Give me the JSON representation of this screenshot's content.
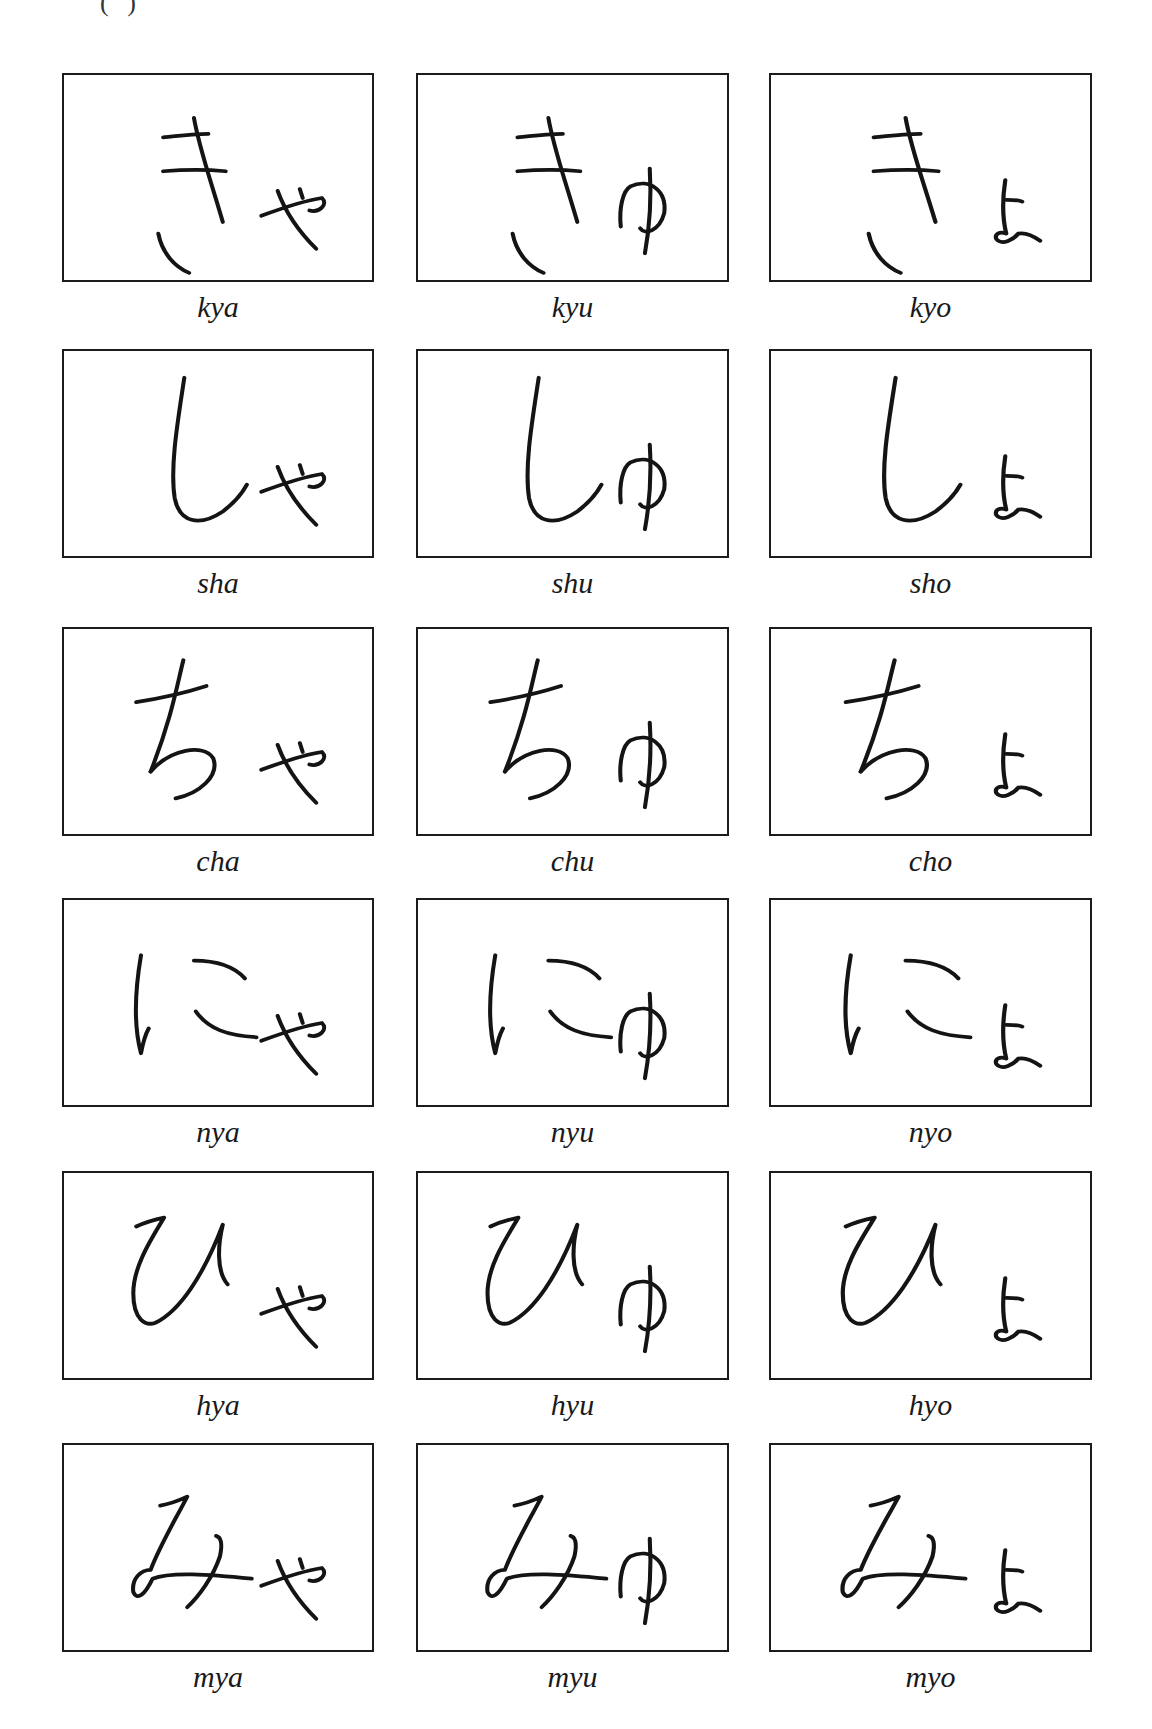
{
  "page": {
    "cropped_header_fragment": "( )"
  },
  "grid": {
    "rows": [
      {
        "base": "き",
        "cells": [
          {
            "kana": "きゃ",
            "romaji": "kya"
          },
          {
            "kana": "きゅ",
            "romaji": "kyu"
          },
          {
            "kana": "きょ",
            "romaji": "kyo"
          }
        ]
      },
      {
        "base": "し",
        "cells": [
          {
            "kana": "しゃ",
            "romaji": "sha"
          },
          {
            "kana": "しゅ",
            "romaji": "shu"
          },
          {
            "kana": "しょ",
            "romaji": "sho"
          }
        ]
      },
      {
        "base": "ち",
        "cells": [
          {
            "kana": "ちゃ",
            "romaji": "cha"
          },
          {
            "kana": "ちゅ",
            "romaji": "chu"
          },
          {
            "kana": "ちょ",
            "romaji": "cho"
          }
        ]
      },
      {
        "base": "に",
        "cells": [
          {
            "kana": "にゃ",
            "romaji": "nya"
          },
          {
            "kana": "にゅ",
            "romaji": "nyu"
          },
          {
            "kana": "にょ",
            "romaji": "nyo"
          }
        ]
      },
      {
        "base": "ひ",
        "cells": [
          {
            "kana": "ひゃ",
            "romaji": "hya"
          },
          {
            "kana": "ひゅ",
            "romaji": "hyu"
          },
          {
            "kana": "ひょ",
            "romaji": "hyo"
          }
        ]
      },
      {
        "base": "み",
        "cells": [
          {
            "kana": "みゃ",
            "romaji": "mya"
          },
          {
            "kana": "みゅ",
            "romaji": "myu"
          },
          {
            "kana": "みょ",
            "romaji": "myo"
          }
        ]
      }
    ]
  }
}
